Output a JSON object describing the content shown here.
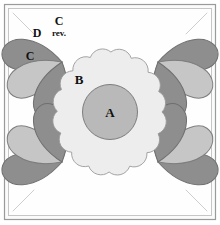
{
  "diagram": {
    "background_color": "#ffffff",
    "frame": {
      "outer_border_color": "#9a9a9a",
      "inner_border_color": "#b5b5b5",
      "fill_color": "#fbfbfb"
    },
    "guide_lines": {
      "name": "corner-diagonal-guides",
      "color": "#c8c8c8",
      "count": 4
    },
    "colors": {
      "center_circle": "#b9b9b9",
      "scallop_shape": "#ededed",
      "petal_dark": "#8e8e8e",
      "petal_light": "#c6c6c6",
      "outline": "#808080"
    },
    "pieces": [
      {
        "id": "A",
        "label": "A",
        "shape": "center-circle",
        "fill": "#b9b9b9"
      },
      {
        "id": "B",
        "label": "B",
        "shape": "scalloped-circle",
        "fill": "#ededed"
      },
      {
        "id": "C",
        "label": "C",
        "shape": "petal",
        "fill": "#8e8e8e"
      },
      {
        "id": "C-rev",
        "label": "C",
        "sublabel": "rev.",
        "shape": "petal-reversed",
        "fill": "#8e8e8e"
      },
      {
        "id": "D",
        "label": "D",
        "shape": "petal",
        "fill": "#c6c6c6"
      }
    ],
    "labels": {
      "a": "A",
      "b": "B",
      "c": "C",
      "c_rev_main": "C",
      "c_rev_sub": "rev.",
      "d": "D"
    },
    "corner_clusters": [
      {
        "position": "top-left",
        "petals": [
          "C rev.",
          "D",
          "C"
        ],
        "labeled": true
      },
      {
        "position": "top-right",
        "petals": [
          "C rev.",
          "D",
          "C"
        ],
        "labeled": false
      },
      {
        "position": "bottom-left",
        "petals": [
          "C rev.",
          "D",
          "C"
        ],
        "labeled": false
      },
      {
        "position": "bottom-right",
        "petals": [
          "C rev.",
          "D",
          "C"
        ],
        "labeled": false
      }
    ]
  }
}
